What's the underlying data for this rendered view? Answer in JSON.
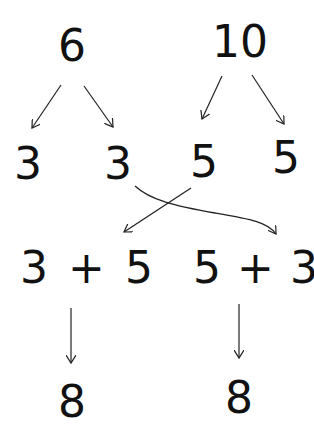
{
  "diagram": {
    "type": "number-bond / commutative addition",
    "top": [
      {
        "value": "6",
        "splits": [
          "3",
          "3"
        ]
      },
      {
        "value": "10",
        "splits": [
          "5",
          "5"
        ]
      }
    ],
    "parts": [
      "3",
      "3",
      "5",
      "5"
    ],
    "expressions": [
      {
        "left": "3",
        "op": "+",
        "right": "5",
        "result": "8"
      },
      {
        "left": "5",
        "op": "+",
        "right": "3",
        "result": "8"
      }
    ],
    "colors": {
      "ink": "#111111",
      "background": "#ffffff"
    }
  }
}
